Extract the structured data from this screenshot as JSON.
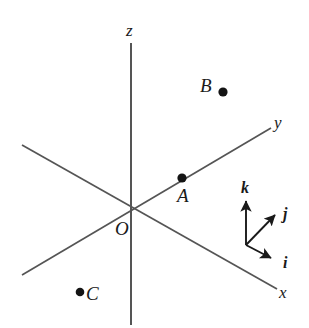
{
  "figure": {
    "background_color": "#ffffff",
    "line_color": "#4a4a4a",
    "ink_color": "#1a1a1a"
  },
  "axes": [
    {
      "name": "z",
      "label": "z",
      "label_x": 126,
      "label_y": 22,
      "x1": 131,
      "y1": 43,
      "x2": 131,
      "y2": 325
    },
    {
      "name": "y",
      "label": "y",
      "label_x": 274,
      "label_y": 114,
      "x1": 22,
      "y1": 275,
      "x2": 271,
      "y2": 128
    },
    {
      "name": "x",
      "label": "x",
      "label_x": 279,
      "label_y": 284,
      "x1": 22,
      "y1": 145,
      "x2": 277,
      "y2": 289
    }
  ],
  "origin": {
    "label": "O",
    "x": 131,
    "y": 210,
    "label_x": 115,
    "label_y": 219
  },
  "points": [
    {
      "name": "A",
      "label": "A",
      "dot_x": 182,
      "dot_y": 178,
      "dot_r": 4.5,
      "label_x": 177,
      "label_y": 186
    },
    {
      "name": "B",
      "label": "B",
      "dot_x": 223,
      "dot_y": 92,
      "dot_r": 4.5,
      "label_x": 200,
      "label_y": 76
    },
    {
      "name": "C",
      "label": "C",
      "dot_x": 80,
      "dot_y": 292,
      "dot_r": 4.5,
      "label_x": 86,
      "label_y": 284
    }
  ],
  "basis_vectors": {
    "origin_x": 246,
    "origin_y": 245,
    "vectors": [
      {
        "name": "k",
        "label": "k",
        "tip_x": 246,
        "tip_y": 199,
        "label_x": 241,
        "label_y": 180
      },
      {
        "name": "j",
        "label": "j",
        "tip_x": 277,
        "tip_y": 213,
        "label_x": 283,
        "label_y": 206
      },
      {
        "name": "i",
        "label": "i",
        "tip_x": 273,
        "tip_y": 259,
        "label_x": 283,
        "label_y": 255
      }
    ]
  }
}
